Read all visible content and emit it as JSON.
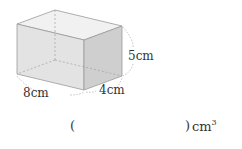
{
  "diagram": {
    "shape": "rectangular-prism",
    "labels": {
      "length": "8cm",
      "width": "4cm",
      "height": "5cm"
    }
  },
  "answer": {
    "open_paren": "(",
    "close_paren": ")",
    "unit_base": "cm",
    "unit_exponent": "3",
    "value": ""
  }
}
